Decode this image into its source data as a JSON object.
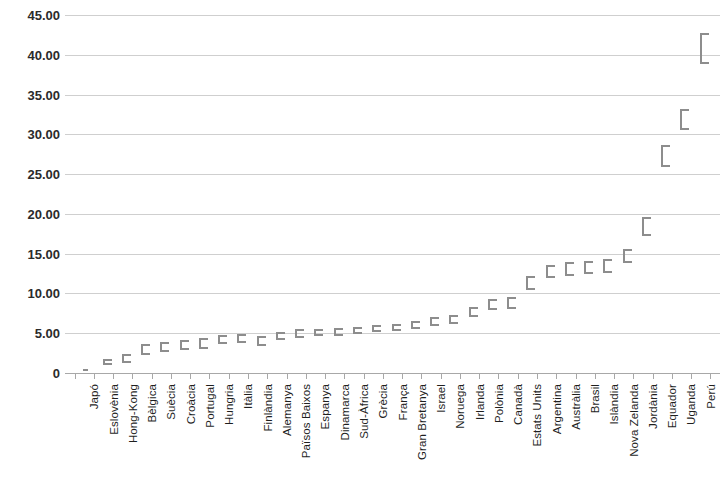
{
  "chart_data": {
    "type": "scatter",
    "title": "",
    "subtitle": "",
    "xlabel": "",
    "ylabel": "",
    "ylim": [
      0,
      45
    ],
    "y_ticks": [
      0,
      5,
      10,
      15,
      20,
      25,
      30,
      35,
      40,
      45
    ],
    "y_tick_labels": [
      "0",
      "5.00",
      "10.00",
      "15.00",
      "20.00",
      "25.00",
      "30.00",
      "35.00",
      "40.00",
      "45.00"
    ],
    "grid": true,
    "legend": "none",
    "marker_style": "range-bar-with-caps",
    "series_color": "#8d8d8d",
    "categories": [
      "Japó",
      "Eslovènia",
      "Hong-Kong",
      "Bèlgica",
      "Suècia",
      "Croàcia",
      "Portugal",
      "Hungria",
      "Itàlia",
      "Finlàndia",
      "Alemanya",
      "Països Baixos",
      "Espanya",
      "Dinamarca",
      "Sud-Àfrica",
      "Grècia",
      "França",
      "Gran Bretanya",
      "Israel",
      "Noruega",
      "Irlanda",
      "Polònia",
      "Canadà",
      "Estats Units",
      "Argentina",
      "Austràlia",
      "Brasil",
      "Islàndia",
      "Nova Zelanda",
      "Jordània",
      "Equador",
      "Uganda",
      "Perú"
    ],
    "values": [
      0.4,
      1.4,
      1.9,
      2.9,
      3.3,
      3.5,
      3.7,
      4.2,
      4.3,
      4.1,
      4.6,
      4.9,
      5.0,
      5.1,
      5.3,
      5.5,
      5.7,
      6.0,
      6.4,
      6.7,
      7.6,
      8.6,
      8.8,
      11.3,
      12.7,
      13.0,
      13.2,
      13.4,
      14.7,
      18.4,
      27.3,
      31.9,
      40.8
    ],
    "range_low": [
      0.3,
      1.0,
      1.3,
      2.2,
      2.7,
      2.9,
      3.0,
      3.6,
      3.8,
      3.4,
      4.1,
      4.4,
      4.6,
      4.7,
      4.9,
      5.1,
      5.3,
      5.5,
      5.9,
      6.2,
      7.0,
      7.9,
      8.1,
      10.4,
      11.9,
      12.2,
      12.4,
      12.6,
      13.8,
      17.2,
      25.9,
      30.6,
      38.9
    ],
    "range_high": [
      0.5,
      1.8,
      2.4,
      3.6,
      3.9,
      4.1,
      4.4,
      4.8,
      4.9,
      4.7,
      5.2,
      5.5,
      5.5,
      5.6,
      5.8,
      6.0,
      6.2,
      6.5,
      7.0,
      7.3,
      8.3,
      9.3,
      9.5,
      12.2,
      13.6,
      13.9,
      14.1,
      14.3,
      15.6,
      19.6,
      28.7,
      33.2,
      42.8
    ]
  }
}
